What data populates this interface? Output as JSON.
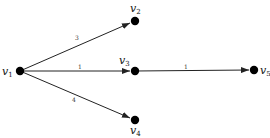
{
  "diagram": {
    "type": "directed-weighted-graph",
    "nodes": [
      {
        "id": "v1",
        "label": "v",
        "sub": "1",
        "x": 20,
        "y": 71
      },
      {
        "id": "v2",
        "label": "v",
        "sub": "2",
        "x": 135,
        "y": 21
      },
      {
        "id": "v3",
        "label": "v",
        "sub": "3",
        "x": 135,
        "y": 71
      },
      {
        "id": "v4",
        "label": "v",
        "sub": "4",
        "x": 135,
        "y": 120
      },
      {
        "id": "v5",
        "label": "v",
        "sub": "5",
        "x": 254,
        "y": 70
      }
    ],
    "edges": [
      {
        "from": "v1",
        "to": "v2",
        "weight": "3"
      },
      {
        "from": "v1",
        "to": "v3",
        "weight": "1"
      },
      {
        "from": "v3",
        "to": "v5",
        "weight": "1"
      },
      {
        "from": "v1",
        "to": "v4",
        "weight": "4"
      }
    ]
  }
}
